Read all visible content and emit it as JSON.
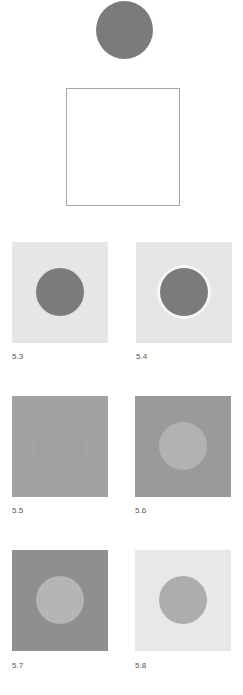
{
  "figure": {
    "top_circle_color": "#7b7b7b",
    "top_square_border_color": "#a8a8a8",
    "panels": [
      {
        "label": "5.3",
        "background": "#e6e6e6",
        "disk": "#7b7b7b",
        "halo": null
      },
      {
        "label": "5.4",
        "background": "#e6e6e6",
        "disk": "#7b7b7b",
        "halo": "#f7f7f7"
      },
      {
        "label": "5.5",
        "background": "#a2a2a2",
        "disk": "#a0a0a0",
        "halo": null
      },
      {
        "label": "5.6",
        "background": "#9a9a9a",
        "disk": "#b2b2b2",
        "halo": null
      },
      {
        "label": "5.7",
        "background": "#8f8f8f",
        "disk": "#b5b5b5",
        "halo": null
      },
      {
        "label": "5.8",
        "background": "#e8e8e8",
        "disk": "#adadad",
        "halo": null
      }
    ]
  }
}
